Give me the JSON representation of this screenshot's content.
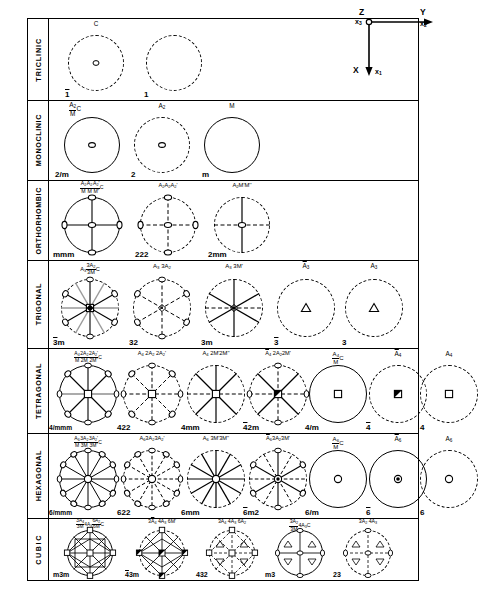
{
  "figure": {
    "axes_key": {
      "name": "coordinate-axes-key",
      "origin_label": "O",
      "vertical_up_label": "Z",
      "vertical_up_sub": "x3",
      "horizontal_label": "Y",
      "horizontal_sub": "x2",
      "down_label": "X",
      "down_sub": "x1"
    }
  },
  "systems": [
    {
      "name": "TRICLINIC",
      "cells": [
        {
          "header": "C",
          "footer": "1̄",
          "circle": "dashed",
          "symbol": "center-of-symmetry"
        },
        {
          "header": "",
          "footer": "1",
          "circle": "dashed",
          "symbol": "none"
        }
      ]
    },
    {
      "name": "MONOCLINIC",
      "cells": [
        {
          "header": "A2/M C",
          "footer": "2/m",
          "circle": "solid",
          "symbol": "twofold-axis"
        },
        {
          "header": "A2",
          "footer": "2",
          "circle": "dashed",
          "symbol": "twofold-axis"
        },
        {
          "header": "M",
          "footer": "m",
          "circle": "solid",
          "symbol": "none"
        }
      ]
    },
    {
      "name": "ORTHORHOMBIC",
      "cells": [
        {
          "header": "A2/M A2/M A2'/M' C",
          "footer": "mmm",
          "circle": "solid",
          "symbol": "three-twofold-axes"
        },
        {
          "header": "A2 A2 A2'",
          "footer": "222",
          "circle": "dashed",
          "symbol": "three-twofold-axes"
        },
        {
          "header": "A2 M' M''",
          "footer": "2mm",
          "circle": "dashed",
          "symbol": "twofold-axis"
        }
      ]
    },
    {
      "name": "TRIGONAL",
      "cells": [
        {
          "header": "A3 3A2/3M C",
          "footer": "3̄m",
          "circle": "dashed",
          "symbol": "threefold-inversion"
        },
        {
          "header": "A3 3A2",
          "footer": "32",
          "circle": "dashed",
          "symbol": "threefold-axis"
        },
        {
          "header": "A3 3M'",
          "footer": "3m",
          "circle": "dashed",
          "symbol": "threefold-axis"
        },
        {
          "header": "Ā3",
          "footer": "3̄",
          "circle": "dashed",
          "symbol": "triangle-open"
        },
        {
          "header": "A3",
          "footer": "3",
          "circle": "dashed",
          "symbol": "triangle-open"
        }
      ]
    },
    {
      "name": "TETRAGONAL",
      "cells": [
        {
          "header": "A4/M 2A2/2M 2A2'/2M' C",
          "footer": "4/mmm",
          "circle": "solid",
          "symbol": "fourfold-axis"
        },
        {
          "header": "A4 2A2 2A2'",
          "footer": "422",
          "circle": "dashed",
          "symbol": "fourfold-axis"
        },
        {
          "header": "A4 2M' 2M''",
          "footer": "4mm",
          "circle": "dashed",
          "symbol": "fourfold-axis"
        },
        {
          "header": "Ā4 2A2 2M'",
          "footer": "4̄2m",
          "circle": "dashed",
          "symbol": "fourfold-inversion"
        },
        {
          "header": "A4/M C",
          "footer": "4/m",
          "circle": "solid",
          "symbol": "square-open"
        },
        {
          "header": "Ā4",
          "footer": "4̄",
          "circle": "dashed",
          "symbol": "square-filled-half"
        },
        {
          "header": "A4",
          "footer": "4",
          "circle": "dashed",
          "symbol": "square-open"
        }
      ]
    },
    {
      "name": "HEXAGONAL",
      "cells": [
        {
          "header": "A6/M 3A2/3M 3A2'/3M' C",
          "footer": "6/mmm",
          "circle": "solid",
          "symbol": "sixfold-axis"
        },
        {
          "header": "A6 3A2 3A2'",
          "footer": "622",
          "circle": "dashed",
          "symbol": "sixfold-axis"
        },
        {
          "header": "A6 3M' 3M''",
          "footer": "6mm",
          "circle": "dashed",
          "symbol": "sixfold-axis"
        },
        {
          "header": "Ā6 3A2 3M'",
          "footer": "6̄m2",
          "circle": "dashed",
          "symbol": "sixfold-inversion"
        },
        {
          "header": "A6/M C",
          "footer": "6/m",
          "circle": "solid",
          "symbol": "hexagon-open"
        },
        {
          "header": "Ā6",
          "footer": "6̄",
          "circle": "solid",
          "symbol": "hexagon-filled"
        },
        {
          "header": "A6",
          "footer": "6",
          "circle": "dashed",
          "symbol": "hexagon-open"
        }
      ]
    },
    {
      "name": "CUBIC",
      "cells": [
        {
          "header": "3A4/3M 4A3 6A2/6M C",
          "footer": "m3m",
          "circle": "solid",
          "symbol": "cubic-full"
        },
        {
          "header": "3Ā4 4A3 6M'",
          "footer": "4̄3m",
          "circle": "dashed",
          "symbol": "cubic-43m"
        },
        {
          "header": "3A4 4A3 6A2",
          "footer": "432",
          "circle": "dashed",
          "symbol": "cubic-432"
        },
        {
          "header": "3A2/3M 4A3 C",
          "footer": "m3",
          "circle": "solid",
          "symbol": "cubic-m3"
        },
        {
          "header": "3A2 4A3",
          "footer": "23",
          "circle": "dashed",
          "symbol": "cubic-23"
        }
      ]
    }
  ]
}
